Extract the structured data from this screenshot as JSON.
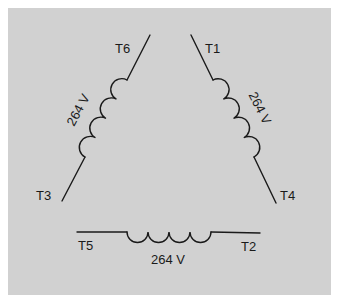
{
  "diagram": {
    "type": "delta-connected windings",
    "background": "#d1d1d1",
    "line_color": "#1a1a1a",
    "terminals": {
      "t1": "T1",
      "t2": "T2",
      "t3": "T3",
      "t4": "T4",
      "t5": "T5",
      "t6": "T6"
    },
    "windings": {
      "left": {
        "voltage": "264 V",
        "ends": [
          "T6",
          "T3"
        ]
      },
      "right": {
        "voltage": "264 V",
        "ends": [
          "T1",
          "T4"
        ]
      },
      "bottom": {
        "voltage": "264 V",
        "ends": [
          "T5",
          "T2"
        ]
      }
    }
  }
}
